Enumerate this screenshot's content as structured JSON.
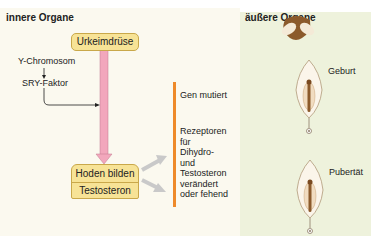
{
  "left_panel": {
    "title": "innere Organe",
    "nodes": {
      "urkeimdruese": "Urkeimdrüse",
      "y_chromosom": "Y-Chromosom",
      "sry_faktor": "SRY-Faktor",
      "hoden_bilden": "Hoden bilden",
      "testosteron": "Testosteron"
    },
    "defects": [
      "Gen mutiert",
      "Rezeptoren\nfür\nDihydro-\nund\nTestosteron\nverändert\noder fehend"
    ]
  },
  "right_panel": {
    "title": "äußere Organe",
    "stages": [
      "Geburt",
      "Pubertät"
    ]
  },
  "colors": {
    "left_bg": "#fbf9ef",
    "right_bg": "#eef2dc",
    "box_fill": "#f7e396",
    "pink_arrow": "#f2a7bc",
    "orange_bar": "#ee8a2a",
    "gray_arrow": "#c9c9c9",
    "tissue_brown": "#8b5a2b"
  }
}
